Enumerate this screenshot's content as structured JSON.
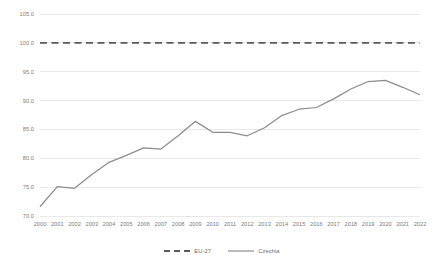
{
  "chart_data": {
    "type": "line",
    "title": "",
    "xlabel": "",
    "ylabel": "",
    "x": [
      "2000",
      "2001",
      "2002",
      "2003",
      "2004",
      "2005",
      "2006",
      "2007",
      "2008",
      "2009",
      "2010",
      "2011",
      "2012",
      "2013",
      "2014",
      "2015",
      "2016",
      "2017",
      "2018",
      "2019",
      "2020",
      "2021",
      "2022"
    ],
    "categories": [
      "2000",
      "2001",
      "2002",
      "2003",
      "2004",
      "2005",
      "2006",
      "2007",
      "2008",
      "2009",
      "2010",
      "2011",
      "2012",
      "2013",
      "2014",
      "2015",
      "2016",
      "2017",
      "2018",
      "2019",
      "2020",
      "2021",
      "2022"
    ],
    "series": [
      {
        "name": "EU-27",
        "style": "dashed",
        "color": "#5a5a5a",
        "values": [
          100.0,
          100.0,
          100.0,
          100.0,
          100.0,
          100.0,
          100.0,
          100.0,
          100.0,
          100.0,
          100.0,
          100.0,
          100.0,
          100.0,
          100.0,
          100.0,
          100.0,
          100.0,
          100.0,
          100.0,
          100.0,
          100.0,
          100.0
        ]
      },
      {
        "name": "Czechia",
        "style": "solid",
        "color": "#8c8c8c",
        "values": [
          71.6,
          75.1,
          74.8,
          77.2,
          79.3,
          80.5,
          81.8,
          81.6,
          83.9,
          86.4,
          84.5,
          84.5,
          83.9,
          85.3,
          87.4,
          88.5,
          88.8,
          90.3,
          92.0,
          93.3,
          93.5,
          92.3,
          91.0
        ]
      }
    ],
    "ylim": [
      70.0,
      105.0
    ],
    "ytick_step": 5.0,
    "yticks": [
      "105.0",
      "100.0",
      "95.0",
      "90.0",
      "85.0",
      "80.0",
      "75.0",
      "70.0"
    ],
    "ytick_values": [
      105.0,
      100.0,
      95.0,
      90.0,
      85.0,
      80.0,
      75.0,
      70.0
    ],
    "grid": true,
    "grid_axis": "y",
    "grid_color": "#e8e8e8",
    "legend_position": "bottom",
    "legend": [
      "EU-27",
      "Czechia"
    ],
    "background": "#ffffff",
    "tick_label_color": "#7b7b7b"
  }
}
